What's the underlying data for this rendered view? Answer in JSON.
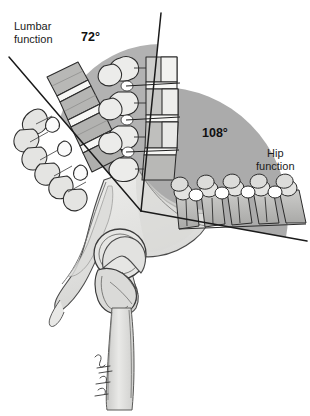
{
  "figure": {
    "background_color": "#ffffff",
    "width": 310,
    "height": 416
  },
  "labels": {
    "lumbar": {
      "line1": "Lumbar",
      "line2": "function",
      "text": "Lumbar\nfunction"
    },
    "hip": {
      "line1": "Hip",
      "line2": "function",
      "text": "Hip\nfunction"
    }
  },
  "measurements": {
    "lumbar_angle": "72°",
    "hip_angle": "108°"
  },
  "colors": {
    "arc_fill": "#b0b0b0",
    "arc_fill_secondary": "#a8a8a8",
    "bone_light": "#e8e8e6",
    "bone_mid": "#bdbdbd",
    "bone_dark": "#9a9a9a",
    "disc_white": "#fbfbfb",
    "outline": "#2a2a2a",
    "text": "#1b1b1b",
    "background": "#ffffff"
  },
  "anatomy": {
    "structures": [
      "lumbar vertebrae chain",
      "sacrum",
      "pelvis / ilium",
      "acetabulum",
      "femoral head",
      "greater trochanter",
      "femur shaft",
      "intervertebral discs"
    ]
  },
  "geometry": {
    "vertex": {
      "x": 141,
      "y": 211
    },
    "lumbar_ray_end": {
      "x": 9,
      "y": 57
    },
    "vertical_ray_end": {
      "x": 161,
      "y": 13
    },
    "hip_ray_end": {
      "x": 307,
      "y": 241
    },
    "lumbar_arc": {
      "cx": 161,
      "cy": 150,
      "r": 106
    },
    "hip_arc": {
      "cx": 160,
      "cy": 215,
      "r": 128
    }
  }
}
